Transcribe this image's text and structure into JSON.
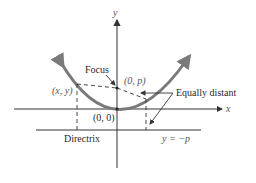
{
  "diagram": {
    "axes": {
      "x_label": "x",
      "y_label": "y"
    },
    "labels": {
      "focus": "Focus",
      "focus_point": "(0, p)",
      "vertex": "(0, 0)",
      "point": "(x, y)",
      "equally_distant": "Equally distant",
      "directrix": "Directrix",
      "directrix_eq": "y = −p"
    },
    "colors": {
      "parabola": "#7a7a7a",
      "axes": "#3a3a3a",
      "dashed": "#333333",
      "text": "#2a2a2a"
    }
  }
}
